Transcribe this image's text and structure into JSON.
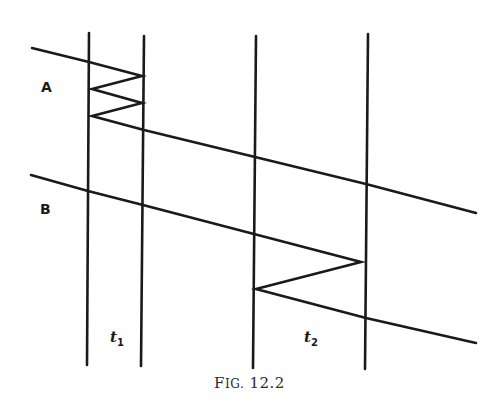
{
  "figure": {
    "caption_prefix": "F",
    "caption_smallcaps": "IG.",
    "caption_number": " 12.2",
    "stroke_color": "#1a1a1a",
    "labels": {
      "A": "A",
      "B": "B",
      "t1": "t",
      "t1_sub": "1",
      "t2": "t",
      "t2_sub": "2"
    },
    "vertical_lines": [
      {
        "id": "v1",
        "x1": 89,
        "y1": 33,
        "x2": 87,
        "y2": 365
      },
      {
        "id": "v2",
        "x1": 144,
        "y1": 36,
        "x2": 141,
        "y2": 366
      },
      {
        "id": "v3",
        "x1": 256,
        "y1": 36,
        "x2": 253,
        "y2": 368
      },
      {
        "id": "v4",
        "x1": 368,
        "y1": 34,
        "x2": 365,
        "y2": 369
      }
    ],
    "path_A": [
      [
        32,
        48
      ],
      [
        89,
        62
      ],
      [
        142,
        76
      ],
      [
        92,
        89
      ],
      [
        142,
        103
      ],
      [
        92,
        116
      ],
      [
        144,
        130
      ],
      [
        255,
        157
      ],
      [
        366,
        184
      ],
      [
        476,
        213
      ]
    ],
    "path_B": [
      [
        31,
        175
      ],
      [
        88,
        191
      ],
      [
        143,
        205
      ],
      [
        254,
        234
      ],
      [
        361,
        262
      ],
      [
        256,
        289
      ],
      [
        366,
        318
      ],
      [
        476,
        343
      ]
    ]
  }
}
